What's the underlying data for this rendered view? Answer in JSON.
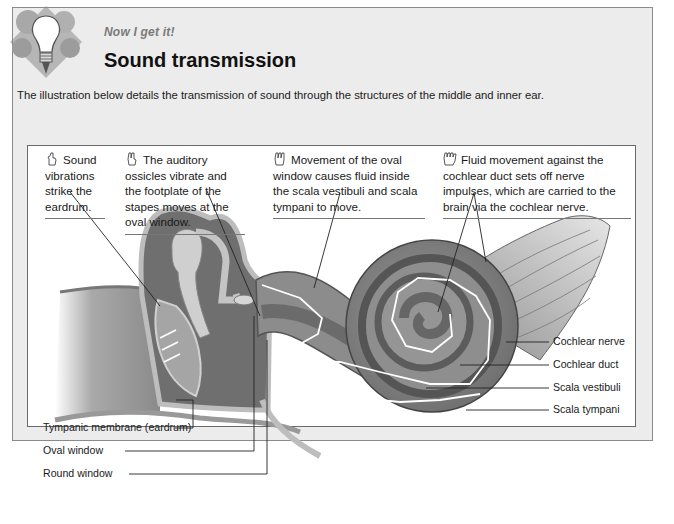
{
  "header": {
    "kicker": "Now I get it!",
    "title": "Sound transmission",
    "intro": "The illustration below details the transmission of sound through the structures of the middle and inner ear."
  },
  "icons": {
    "header_icon": "lightbulb-gears-icon",
    "callout_icon": "hand-count-icon"
  },
  "callouts": [
    {
      "step": 1,
      "text": "Sound vibrations strike the eardrum.",
      "lines": [
        "Sound",
        "vibrations",
        "strike the",
        "eardrum."
      ]
    },
    {
      "step": 2,
      "text": "The auditory ossicles vibrate and the footplate of the stapes moves at the oval window.",
      "lines": [
        "The auditory ossicles",
        "vibrate and the footplate",
        "of the stapes moves at",
        "the oval window."
      ]
    },
    {
      "step": 3,
      "text": "Movement of the oval window causes fluid inside the scala vestibuli and scala tympani to move.",
      "lines": [
        "Movement of the oval",
        "window causes fluid inside",
        "the scala vestibuli and scala",
        "tympani to move."
      ]
    },
    {
      "step": 4,
      "text": "Fluid movement against the cochlear duct sets off nerve impulses, which are carried to the brain via the cochlear nerve.",
      "lines": [
        "Fluid movement against the",
        "cochlear duct sets off nerve impulses,",
        "which are carried to the brain via the",
        "cochlear nerve."
      ]
    }
  ],
  "labels_right": [
    "Cochlear nerve",
    "Cochlear duct",
    "Scala vestibuli",
    "Scala tympani"
  ],
  "labels_left": [
    "Tympanic membrane (eardrum)",
    "Oval window",
    "Round window"
  ],
  "colors": {
    "panel_bg": "#ececec",
    "panel_border": "#8a8a8a",
    "kicker": "#7a7a7a",
    "figure_bg": "#ffffff",
    "anatomy_dark": "#6b6b6b",
    "anatomy_mid": "#9a9a9a",
    "anatomy_light": "#c8c8c8",
    "arrow": "#ffffff"
  }
}
